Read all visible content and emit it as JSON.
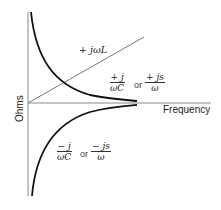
{
  "diagram": {
    "axes": {
      "y_label": "Ohms",
      "x_label": "Frequency",
      "color": "#888888"
    },
    "curves": [
      {
        "name": "inductive-reactance",
        "shape": "line",
        "label": "+ jωL",
        "color": "#777777"
      },
      {
        "name": "capacitive-reactance-positive",
        "shape": "hyperbola",
        "label_a": {
          "num": "+ j",
          "den": "ωC"
        },
        "connector": "or",
        "label_b": {
          "num": "+ js",
          "den": "ω"
        },
        "color": "#111111"
      },
      {
        "name": "capacitive-reactance-negative",
        "shape": "hyperbola",
        "label_a": {
          "num": "− j",
          "den": "ωC"
        },
        "connector": "or",
        "label_b": {
          "num": "− js",
          "den": "ω"
        },
        "color": "#111111"
      }
    ]
  }
}
